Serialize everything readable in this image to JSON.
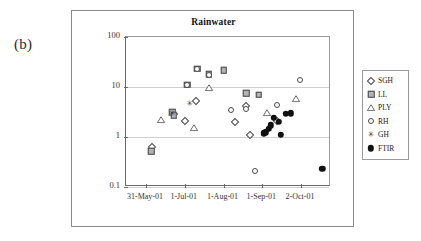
{
  "figure": {
    "panel_label": "(b)"
  },
  "chart_data": {
    "type": "scatter",
    "title": "Rainwater",
    "xlabel": "",
    "ylabel": "(HCl/SO2) mass ratio",
    "ylabel_display": "(HCl/SO₂) mass ratio",
    "yscale": "log",
    "ylim": [
      0.1,
      100
    ],
    "ytick_labels": [
      "100",
      "10",
      "1",
      "0.1"
    ],
    "ytick_values": [
      100,
      10,
      1,
      0.1
    ],
    "xtick_labels": [
      "31-May-01",
      "1-Jul-01",
      "1-Aug-01",
      "1-Sep-01",
      "2-Oct-01"
    ],
    "xtick_days": [
      0,
      31,
      62,
      93,
      124
    ],
    "xlim_days": [
      -16,
      148
    ],
    "grid": "horizontal",
    "legend_position": "right-outside",
    "series": [
      {
        "name": "SGH",
        "marker": "open-diamond",
        "points": [
          {
            "x": 5,
            "y": 0.62
          },
          {
            "x": 22,
            "y": 2.95
          },
          {
            "x": 31,
            "y": 2.1
          },
          {
            "x": 40,
            "y": 5.3
          },
          {
            "x": 71,
            "y": 2.0
          },
          {
            "x": 80,
            "y": 4.2
          },
          {
            "x": 83,
            "y": 1.12
          },
          {
            "x": 105,
            "y": 2.1
          }
        ]
      },
      {
        "name": "LL",
        "marker": "filled-square",
        "points": [
          {
            "x": 4,
            "y": 0.52
          },
          {
            "x": 21,
            "y": 3.1
          },
          {
            "x": 22,
            "y": 2.7
          },
          {
            "x": 33,
            "y": 11.2
          },
          {
            "x": 41,
            "y": 23.0
          },
          {
            "x": 50,
            "y": 18.0
          },
          {
            "x": 62,
            "y": 21.5
          },
          {
            "x": 80,
            "y": 7.5
          },
          {
            "x": 90,
            "y": 7.0
          }
        ]
      },
      {
        "name": "PLY",
        "marker": "open-triangle",
        "points": [
          {
            "x": 12,
            "y": 2.2
          },
          {
            "x": 38,
            "y": 1.5
          },
          {
            "x": 50,
            "y": 9.5
          },
          {
            "x": 97,
            "y": 3.0
          },
          {
            "x": 120,
            "y": 5.8
          }
        ]
      },
      {
        "name": "RH",
        "marker": "open-circle",
        "points": [
          {
            "x": 33,
            "y": 11.0
          },
          {
            "x": 41,
            "y": 22.5
          },
          {
            "x": 50,
            "y": 17.0
          },
          {
            "x": 68,
            "y": 3.5
          },
          {
            "x": 80,
            "y": 3.7
          },
          {
            "x": 87,
            "y": 0.21
          },
          {
            "x": 105,
            "y": 4.3
          },
          {
            "x": 123,
            "y": 14.0
          }
        ]
      },
      {
        "name": "GH",
        "marker": "star",
        "points": [
          {
            "x": 21,
            "y": 2.9
          },
          {
            "x": 35,
            "y": 4.6
          }
        ]
      },
      {
        "name": "FTIR",
        "marker": "filled-circle",
        "points": [
          {
            "x": 94,
            "y": 1.18
          },
          {
            "x": 96,
            "y": 1.25
          },
          {
            "x": 98,
            "y": 1.45
          },
          {
            "x": 100,
            "y": 1.7
          },
          {
            "x": 102,
            "y": 2.4
          },
          {
            "x": 106,
            "y": 2.0
          },
          {
            "x": 108,
            "y": 1.1
          },
          {
            "x": 112,
            "y": 2.9
          },
          {
            "x": 116,
            "y": 3.0
          },
          {
            "x": 141,
            "y": 0.23
          }
        ]
      }
    ],
    "legend_entries": [
      {
        "label": "SGH",
        "marker": "open-diamond"
      },
      {
        "label": "LL",
        "marker": "filled-square"
      },
      {
        "label": "PLY",
        "marker": "open-triangle"
      },
      {
        "label": "RH",
        "marker": "open-circle"
      },
      {
        "label": "GH",
        "marker": "star"
      },
      {
        "label": "FTIR",
        "marker": "filled-circle"
      }
    ],
    "star_glyph": "✳"
  }
}
